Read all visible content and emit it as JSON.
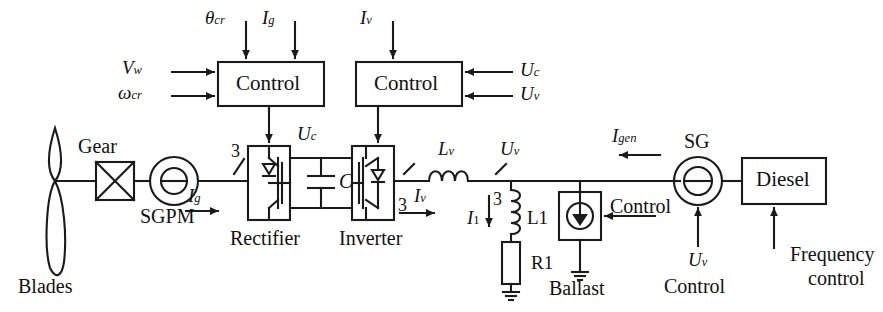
{
  "diagram": {
    "stroke_color": "#1a1a1a",
    "background_color": "#ffffff"
  },
  "blocks": {
    "control_rectifier": "Control",
    "control_inverter": "Control",
    "diesel": "Diesel",
    "rectifier_label": "Rectifier",
    "inverter_label": "Inverter",
    "ballast_control": "Control"
  },
  "components": {
    "blades": "Blades",
    "gear": "Gear",
    "sgpm": "SGPM",
    "sg": "SG",
    "ballast": "Ballast",
    "capacitor": "C",
    "inductor_l1": "L1",
    "resistor_r1": "R1",
    "frequency_control_line1": "Frequency",
    "frequency_control_line2": "control",
    "uv_control": "Control"
  },
  "signals": {
    "theta_cr": {
      "base": "θ",
      "sub": "cr"
    },
    "i_g_top": {
      "base": "I",
      "sub": "g"
    },
    "i_v_top": {
      "base": "I",
      "sub": "v"
    },
    "v_w": {
      "base": "V",
      "sub": "w"
    },
    "omega_cr": {
      "base": "ω",
      "sub": "cr"
    },
    "u_c_right": {
      "base": "U",
      "sub": "c"
    },
    "u_v_right": {
      "base": "U",
      "sub": "v"
    },
    "i_g_line": {
      "base": "I",
      "sub": "g"
    },
    "u_c_dc": {
      "base": "U",
      "sub": "c"
    },
    "i_v_line": {
      "base": "I",
      "sub": "v"
    },
    "l_v": {
      "base": "L",
      "sub": "v"
    },
    "u_v_bus": {
      "base": "U",
      "sub": "v"
    },
    "i_1": {
      "base": "I",
      "sub": "1"
    },
    "i_gen": {
      "base": "I",
      "sub": "gen"
    },
    "u_v_bottom": {
      "base": "U",
      "sub": "v"
    }
  },
  "phase_marks": {
    "rectifier_in": "3",
    "inverter_out": "3",
    "bus": "3"
  }
}
